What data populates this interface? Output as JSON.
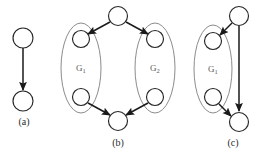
{
  "figure": {
    "panels": [
      {
        "id": "a",
        "caption": "(a)",
        "caption_x": 24,
        "caption_y": 125,
        "nodes": [
          {
            "name": "panel-a-top-node",
            "cx": 23,
            "cy": 38,
            "r": 10
          },
          {
            "name": "panel-a-bottom-node",
            "cx": 23,
            "cy": 101,
            "r": 10
          }
        ],
        "edges": [
          {
            "name": "panel-a-edge-top-to-bottom",
            "x1": 23,
            "y1": 48,
            "x2": 23,
            "y2": 90
          }
        ],
        "hulls": [],
        "group_labels": []
      },
      {
        "id": "b",
        "caption": "(b)",
        "caption_x": 118,
        "caption_y": 146,
        "nodes": [
          {
            "name": "panel-b-source-node",
            "cx": 118,
            "cy": 16,
            "r": 9.5
          },
          {
            "name": "panel-b-g1-entry-node",
            "cx": 81,
            "cy": 39,
            "r": 8.5
          },
          {
            "name": "panel-b-g1-exit-node",
            "cx": 81,
            "cy": 97,
            "r": 8.5
          },
          {
            "name": "panel-b-g2-entry-node",
            "cx": 155,
            "cy": 39,
            "r": 8.5
          },
          {
            "name": "panel-b-g2-exit-node",
            "cx": 155,
            "cy": 97,
            "r": 8.5
          },
          {
            "name": "panel-b-sink-node",
            "cx": 118,
            "cy": 121,
            "r": 9.5
          }
        ],
        "edges": [
          {
            "name": "panel-b-edge-source-to-g1",
            "x1": 110,
            "y1": 22,
            "x2": 88,
            "y2": 34
          },
          {
            "name": "panel-b-edge-source-to-g2",
            "x1": 126,
            "y1": 22,
            "x2": 148,
            "y2": 34
          },
          {
            "name": "panel-b-edge-g1-to-sink",
            "x1": 88,
            "y1": 103,
            "x2": 110,
            "y2": 115
          },
          {
            "name": "panel-b-edge-g2-to-sink",
            "x1": 148,
            "y1": 103,
            "x2": 126,
            "y2": 115
          }
        ],
        "hulls": [
          {
            "name": "panel-b-g1-hull",
            "cx": 81,
            "cy": 68,
            "rx": 20,
            "ry": 45
          },
          {
            "name": "panel-b-g2-hull",
            "cx": 155,
            "cy": 68,
            "rx": 20,
            "ry": 45
          }
        ],
        "group_labels": [
          {
            "name": "panel-b-g1-label",
            "text": "G",
            "sub": "1",
            "x": 76,
            "y": 71
          },
          {
            "name": "panel-b-g2-label",
            "text": "G",
            "sub": "2",
            "x": 150,
            "y": 71
          }
        ]
      },
      {
        "id": "c",
        "caption": "(c)",
        "caption_x": 233,
        "caption_y": 146,
        "nodes": [
          {
            "name": "panel-c-source-node",
            "cx": 239,
            "cy": 16,
            "r": 9.5
          },
          {
            "name": "panel-c-g1-entry-node",
            "cx": 213,
            "cy": 41,
            "r": 8.5
          },
          {
            "name": "panel-c-g1-exit-node",
            "cx": 213,
            "cy": 97,
            "r": 8.5
          },
          {
            "name": "panel-c-sink-node",
            "cx": 239,
            "cy": 122,
            "r": 9.5
          }
        ],
        "edges": [
          {
            "name": "panel-c-edge-source-to-g1",
            "x1": 232,
            "y1": 23,
            "x2": 220,
            "y2": 35
          },
          {
            "name": "panel-c-edge-source-to-sink",
            "x1": 239,
            "y1": 26,
            "x2": 239,
            "y2": 111
          },
          {
            "name": "panel-c-edge-g1-to-sink",
            "x1": 219,
            "y1": 104,
            "x2": 231,
            "y2": 116
          }
        ],
        "hulls": [
          {
            "name": "panel-c-g1-hull",
            "cx": 213,
            "cy": 69,
            "rx": 19,
            "ry": 44
          }
        ],
        "group_labels": [
          {
            "name": "panel-c-g1-label",
            "text": "G",
            "sub": "1",
            "x": 208,
            "y": 72
          }
        ]
      }
    ],
    "colors": {
      "node_stroke": "#262626",
      "node_fill": "#ffffff",
      "hull_stroke": "#8c8c8c",
      "edge_stroke": "#1a1a1a",
      "label_fill": "#5a5a5a",
      "caption_fill": "#2b2b2b",
      "background": "#ffffff"
    }
  }
}
